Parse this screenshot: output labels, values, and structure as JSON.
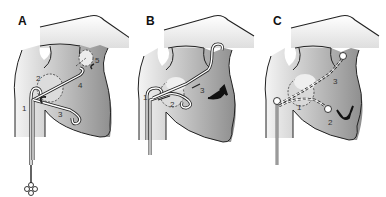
{
  "figure": {
    "panels": [
      {
        "letter": "A",
        "labels": [
          {
            "text": "1",
            "x": 22,
            "y": 104
          },
          {
            "text": "2",
            "x": 36,
            "y": 74
          },
          {
            "text": "3",
            "x": 58,
            "y": 110
          },
          {
            "text": "4",
            "x": 78,
            "y": 81
          },
          {
            "text": "5",
            "x": 95,
            "y": 56
          }
        ]
      },
      {
        "letter": "B",
        "labels": [
          {
            "text": "1",
            "x": 143,
            "y": 93
          },
          {
            "text": "2",
            "x": 170,
            "y": 100
          },
          {
            "text": "3",
            "x": 200,
            "y": 86
          }
        ]
      },
      {
        "letter": "C",
        "labels": [
          {
            "text": "1",
            "x": 297,
            "y": 103
          },
          {
            "text": "2",
            "x": 328,
            "y": 118
          },
          {
            "text": "3",
            "x": 333,
            "y": 77
          }
        ]
      }
    ],
    "colors": {
      "outline": "#222222",
      "fill_dark": "#9a9a9a",
      "fill_light": "#e6e6e6",
      "background": "#ffffff"
    }
  }
}
